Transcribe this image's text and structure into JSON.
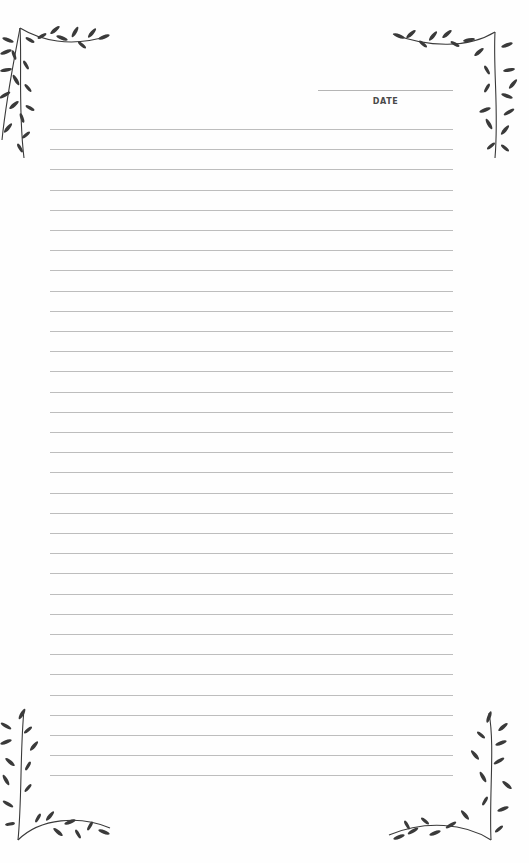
{
  "header": {
    "date_label": "DATE"
  },
  "ruled_lines": {
    "count": 33,
    "first_y": 129,
    "spacing": 20.2,
    "left": 50,
    "width": 403
  },
  "colors": {
    "line": "#bdbdbd",
    "ink": "#3a3a3a",
    "background": "#fefefe"
  },
  "decorations": [
    "vine-corner-top-left",
    "vine-corner-top-right",
    "vine-corner-bottom-left",
    "vine-corner-bottom-right"
  ]
}
